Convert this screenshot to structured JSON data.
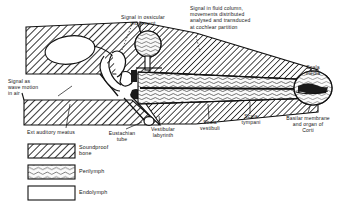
{
  "diagram": {
    "annotations": [
      {
        "key": "wave_motion",
        "text": "Signal as\nwave motion\nin  air",
        "x": 8,
        "y": 78
      },
      {
        "key": "ossicular",
        "text": "Signal in ossicular\nmovement",
        "x": 112,
        "y": 14
      },
      {
        "key": "fluid_column",
        "text": "Signal in fluid column,\nmovements distributed\nanalysed and transduced\nat  cochlear  partition",
        "x": 190,
        "y": 5
      },
      {
        "key": "scala_media",
        "text": "Scala\nmedia",
        "x": 305,
        "y": 66
      },
      {
        "key": "basilar_membrane",
        "text": "Basilar membrane\nand organ of\nCorti",
        "x": 275,
        "y": 115
      },
      {
        "key": "scala_tympani",
        "text": "Scala\ntympani",
        "x": 238,
        "y": 116
      },
      {
        "key": "scala_vestibuli",
        "text": "Scala\nvestibuli",
        "x": 196,
        "y": 121
      },
      {
        "key": "vestibular_labyrinth",
        "text": "Vestibular\nlabyrinth",
        "x": 148,
        "y": 127
      },
      {
        "key": "eustachian_tube",
        "text": "Eustachian\ntube",
        "x": 105,
        "y": 131
      },
      {
        "key": "ext_auditory_meatus",
        "text": "Ext auditory meatus",
        "x": 27,
        "y": 130
      }
    ],
    "legend": {
      "items": [
        {
          "key": "soundproof-bone",
          "label": "Soundproof\nbone",
          "pattern": "hatch",
          "swatch_x": 28,
          "swatch_y": 144,
          "swatch_w": 47,
          "swatch_h": 14,
          "label_x": 79,
          "label_y": 145
        },
        {
          "key": "perilymph",
          "label": "Perilymph",
          "pattern": "wave",
          "swatch_x": 28,
          "swatch_y": 165,
          "swatch_w": 47,
          "swatch_h": 14,
          "label_x": 79,
          "label_y": 169
        },
        {
          "key": "endolymph",
          "label": "Endolymph",
          "pattern": "blank",
          "swatch_x": 28,
          "swatch_y": 186,
          "swatch_w": 47,
          "swatch_h": 14,
          "label_x": 79,
          "label_y": 190
        }
      ]
    },
    "colors": {
      "ink": "#111111",
      "background": "#ffffff",
      "bone_fill": "#ffffff",
      "membrane": "#1a1a1a",
      "perilymph_fill": "#f2f2f2"
    }
  }
}
